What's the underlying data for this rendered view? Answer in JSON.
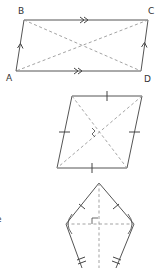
{
  "figures": {
    "parallelogram": {
      "vertices": {
        "A": "A",
        "B": "B",
        "C": "C",
        "D": "D"
      },
      "markings": [
        "double-arrow on BC",
        "double-arrow on AD",
        "single-arrow on AB",
        "single-arrow on DC"
      ],
      "diagonals": "dashed"
    },
    "rhombus": {
      "markings": [
        "tick on each of 4 sides",
        "right angle at diagonal intersection"
      ],
      "diagonals": "dashed"
    },
    "kite": {
      "markings": [
        "single tick on upper sides",
        "double tick on lower sides",
        "right angle at diagonal intersection",
        "equal angle arcs at side vertices"
      ],
      "diagonals": "dashed"
    }
  },
  "edge_text": {
    "left_fragment": "e"
  },
  "colors": {
    "line": "#555555",
    "dashed": "#999999",
    "background": "#ffffff"
  }
}
